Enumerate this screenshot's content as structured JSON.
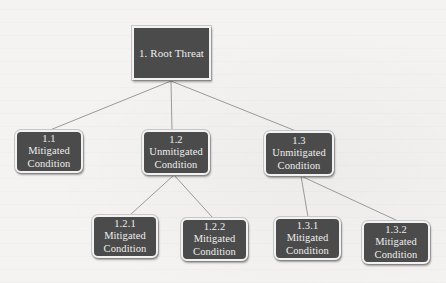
{
  "diagram": {
    "type": "threat-tree",
    "colors": {
      "node_fill": "#4b4b4b",
      "node_text": "#eeeeee",
      "node_border": "#f2f2f2",
      "connector": "#9a9a9a",
      "background": "#f4f3f1"
    },
    "root": {
      "id": "1",
      "label": "1. Root Threat"
    },
    "nodes": [
      {
        "id": "1.1",
        "number": "1.1",
        "line1": "Mitigated",
        "line2": "Condition",
        "parent": "1"
      },
      {
        "id": "1.2",
        "number": "1.2",
        "line1": "Unmitigated",
        "line2": "Condition",
        "parent": "1"
      },
      {
        "id": "1.3",
        "number": "1.3",
        "line1": "Unmitigated",
        "line2": "Condition",
        "parent": "1"
      },
      {
        "id": "1.2.1",
        "number": "1.2.1",
        "line1": "Mitigated",
        "line2": "Condition",
        "parent": "1.2"
      },
      {
        "id": "1.2.2",
        "number": "1.2.2",
        "line1": "Mitigated",
        "line2": "Condition",
        "parent": "1.2"
      },
      {
        "id": "1.3.1",
        "number": "1.3.1",
        "line1": "Mitigated",
        "line2": "Condition",
        "parent": "1.3"
      },
      {
        "id": "1.3.2",
        "number": "1.3.2",
        "line1": "Mitigated",
        "line2": "Condition",
        "parent": "1.3"
      }
    ],
    "edges": [
      {
        "from": "1",
        "to": "1.1"
      },
      {
        "from": "1",
        "to": "1.2"
      },
      {
        "from": "1",
        "to": "1.3"
      },
      {
        "from": "1.2",
        "to": "1.2.1"
      },
      {
        "from": "1.2",
        "to": "1.2.2"
      },
      {
        "from": "1.3",
        "to": "1.3.1"
      },
      {
        "from": "1.3",
        "to": "1.3.2"
      }
    ]
  }
}
